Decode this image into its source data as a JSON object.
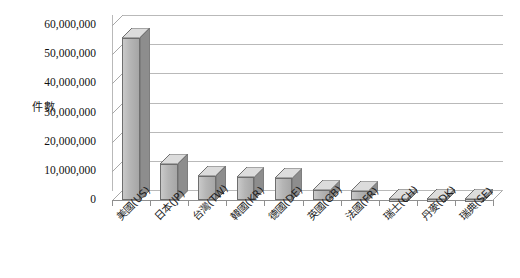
{
  "chart_data": {
    "type": "bar",
    "title": "",
    "xlabel": "",
    "ylabel": "件數",
    "ylim": [
      0,
      60000000
    ],
    "grid": true,
    "legend": "none",
    "three_d": true,
    "categories": [
      "美國(US)",
      "日本(JP)",
      "台灣(TW)",
      "韓國(KR)",
      "德國(DE)",
      "英國(GB)",
      "法國(FR)",
      "瑞士(CH)",
      "丹麥(DK)",
      "瑞典(SE)"
    ],
    "values": [
      55500000,
      12500000,
      8200000,
      7800000,
      7500000,
      3500000,
      3200000,
      250000,
      250000,
      250000
    ],
    "ytick_labels": [
      "60,000,000",
      "50,000,000",
      "40,000,000",
      "30,000,000",
      "20,000,000",
      "10,000,000",
      "0"
    ],
    "ytick_values": [
      60000000,
      50000000,
      40000000,
      30000000,
      20000000,
      10000000,
      0
    ]
  },
  "axis": {
    "y_title": "件數"
  }
}
